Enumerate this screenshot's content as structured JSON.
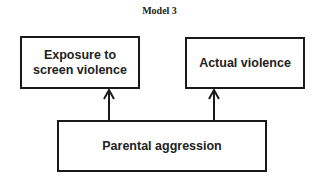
{
  "title": "Model 3",
  "nodes": {
    "exposure": {
      "label_line1": "Exposure to",
      "label_line2": "screen violence"
    },
    "actual": {
      "label": "Actual violence"
    },
    "parental": {
      "label": "Parental aggression"
    }
  },
  "edges": [
    {
      "from": "Parental aggression",
      "to": "Exposure to screen violence"
    },
    {
      "from": "Parental aggression",
      "to": "Actual violence"
    }
  ]
}
